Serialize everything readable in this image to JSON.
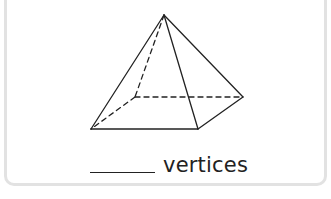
{
  "card": {
    "figure": {
      "name": "square pyramid",
      "vertices": {
        "apex": [
          164,
          15
        ],
        "front_left": [
          91,
          129
        ],
        "front_right": [
          198,
          129
        ],
        "back_right": [
          243,
          97
        ],
        "back_left_hidden": [
          135,
          97
        ]
      },
      "line_color": "#222222"
    },
    "answer": {
      "blank": "",
      "label": "vertices"
    }
  }
}
